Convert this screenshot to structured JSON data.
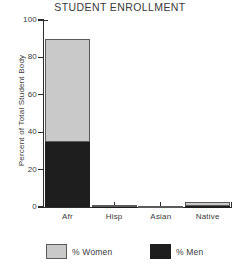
{
  "chart_data": {
    "type": "bar",
    "subtype": "stacked",
    "title": "STUDENT ENROLLMENT",
    "xlabel": "",
    "ylabel": "Percent of Total Student Body",
    "categories": [
      "Afr",
      "Hisp",
      "Asian",
      "Native"
    ],
    "series": [
      {
        "name": "% Men",
        "color": "#1e1e1e",
        "values": [
          35,
          0.4,
          0.3,
          0.5
        ]
      },
      {
        "name": "% Women",
        "color": "#c9c9c9",
        "values": [
          55,
          0.6,
          0.4,
          2.0
        ]
      }
    ],
    "totals": [
      90,
      1,
      0.7,
      2.5
    ],
    "ylim": [
      0,
      100
    ],
    "yticks": [
      0,
      20,
      40,
      60,
      80,
      100
    ],
    "ytick_labels": [
      "0",
      "20",
      "40",
      "60",
      "80",
      "100"
    ],
    "grid": false,
    "legend": {
      "position": "bottom",
      "entries": [
        {
          "label": "% Women",
          "color": "#c9c9c9"
        },
        {
          "label": "% Men",
          "color": "#1e1e1e"
        }
      ]
    },
    "axis_color": "#2e2e2e",
    "background": "#ffffff"
  }
}
